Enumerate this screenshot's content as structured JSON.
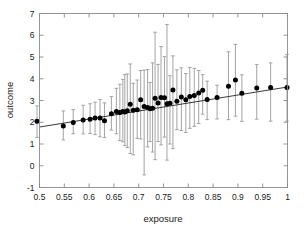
{
  "chart_data": {
    "type": "scatter",
    "title": "",
    "xlabel": "exposure",
    "ylabel": "outcome",
    "xlim": [
      0.5,
      1.0
    ],
    "ylim": [
      -1,
      7
    ],
    "xticks": [
      0.5,
      0.55,
      0.6,
      0.65,
      0.7,
      0.75,
      0.8,
      0.85,
      0.9,
      0.95,
      1
    ],
    "xticklabels": [
      "0.5",
      "0.55",
      "0.6",
      "0.65",
      "0.7",
      "0.75",
      "0.8",
      "0.85",
      "0.9",
      "0.95",
      "1"
    ],
    "yticks": [
      -1,
      0,
      1,
      2,
      3,
      4,
      5,
      6,
      7
    ],
    "yticklabels": [
      "-1",
      "0",
      "1",
      "2",
      "3",
      "4",
      "5",
      "6",
      "7"
    ],
    "grid": false,
    "legend": null,
    "marker": "filled-circle",
    "marker_color": "#000000",
    "errorbar_color": "#9a9a9a",
    "fitline_color": "#222222",
    "series": [
      {
        "name": "outcome vs exposure",
        "x": [
          0.495,
          0.548,
          0.568,
          0.588,
          0.602,
          0.612,
          0.622,
          0.631,
          0.645,
          0.655,
          0.662,
          0.668,
          0.672,
          0.677,
          0.683,
          0.689,
          0.697,
          0.704,
          0.711,
          0.718,
          0.723,
          0.728,
          0.733,
          0.739,
          0.745,
          0.752,
          0.757,
          0.763,
          0.769,
          0.777,
          0.786,
          0.795,
          0.803,
          0.812,
          0.821,
          0.829,
          0.838,
          0.858,
          0.881,
          0.895,
          0.908,
          0.938,
          0.966,
          0.999
        ],
        "y": [
          2.05,
          1.83,
          1.99,
          2.1,
          2.14,
          2.19,
          2.19,
          2.07,
          2.39,
          2.49,
          2.45,
          2.49,
          2.47,
          2.53,
          2.83,
          2.55,
          2.57,
          3.03,
          2.72,
          2.68,
          2.62,
          2.64,
          3.1,
          2.88,
          3.14,
          3.13,
          2.85,
          2.87,
          3.48,
          2.96,
          3.16,
          3.03,
          3.18,
          3.23,
          3.34,
          3.47,
          3.05,
          3.14,
          3.66,
          3.94,
          3.33,
          3.57,
          3.6,
          3.6
        ],
        "ylow": [
          1.3,
          1.19,
          1.47,
          1.46,
          1.48,
          1.43,
          1.33,
          1.3,
          1.64,
          1.47,
          1.16,
          1.1,
          0.93,
          0.84,
          0.56,
          0.5,
          1.26,
          1.23,
          -0.42,
          0.87,
          1.11,
          0.63,
          0.28,
          1.11,
          0.96,
          1.32,
          0.26,
          1.0,
          0.79,
          1.66,
          1.62,
          1.53,
          1.72,
          1.81,
          1.94,
          2.37,
          2.12,
          2.15,
          2.12,
          2.28,
          2.04,
          2.14,
          2.05,
          2.05
        ],
        "yhigh": [
          2.75,
          2.52,
          2.58,
          2.78,
          2.85,
          2.92,
          3.05,
          2.89,
          3.18,
          3.56,
          3.75,
          3.97,
          4.19,
          4.22,
          4.68,
          3.79,
          3.94,
          4.38,
          4.4,
          4.42,
          3.83,
          4.73,
          6.14,
          4.66,
          5.48,
          5.02,
          6.49,
          4.14,
          5.05,
          4.41,
          4.5,
          4.24,
          4.52,
          4.48,
          4.38,
          4.19,
          3.89,
          3.7,
          5.24,
          5.58,
          4.18,
          4.65,
          4.73,
          5.12
        ]
      }
    ],
    "fit_line": {
      "x": [
        0.5,
        1.0
      ],
      "y": [
        1.78,
        3.62
      ]
    }
  }
}
